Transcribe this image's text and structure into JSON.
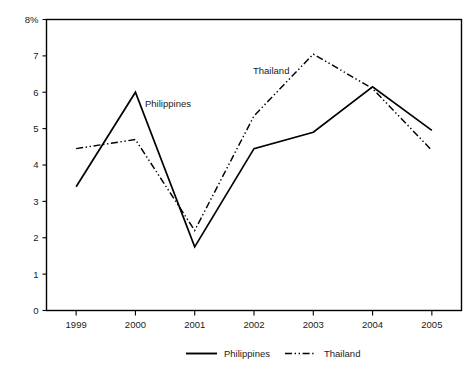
{
  "chart_data": {
    "type": "line",
    "title": "",
    "subtitle": "",
    "xlabel": "",
    "ylabel": "",
    "yunit": "%",
    "yaxis_top_label": "8%",
    "categories": [
      "1999",
      "2000",
      "2001",
      "2002",
      "2003",
      "2004",
      "2005"
    ],
    "x": [
      1999,
      2000,
      2001,
      2002,
      2003,
      2004,
      2005
    ],
    "ylim": [
      0,
      8
    ],
    "ytick_labels": [
      "0",
      "1",
      "2",
      "3",
      "4",
      "5",
      "6",
      "7",
      "8%"
    ],
    "ytick_values": [
      0,
      1,
      2,
      3,
      4,
      5,
      6,
      7,
      8
    ],
    "grid": false,
    "legend_position": "bottom-center",
    "series": [
      {
        "name": "Philippines",
        "linestyle": "solid",
        "color": "#000000",
        "values": [
          3.4,
          6.0,
          1.75,
          4.45,
          4.9,
          6.15,
          4.95
        ]
      },
      {
        "name": "Thailand",
        "linestyle": "dash-dot",
        "color": "#000000",
        "values": [
          4.45,
          4.7,
          2.2,
          5.35,
          7.05,
          6.1,
          4.4
        ]
      }
    ],
    "annotations": [
      {
        "text": "Philippines",
        "x_px": 145,
        "y_px": 107
      },
      {
        "text": "Thailand",
        "x_px": 253,
        "y_px": 74
      }
    ]
  },
  "legend": {
    "items": [
      {
        "label": "Philippines",
        "style": "solid"
      },
      {
        "label": "Thailand",
        "style": "dash-dot"
      }
    ]
  }
}
